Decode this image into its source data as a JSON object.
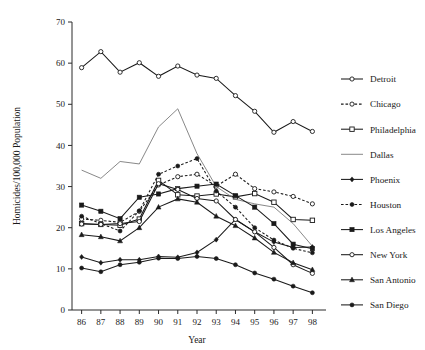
{
  "chart_data": {
    "type": "line",
    "title": "",
    "xlabel": "Year",
    "ylabel": "Homicides/100,000 Population",
    "categories": [
      "86",
      "87",
      "88",
      "89",
      "90",
      "91",
      "92",
      "93",
      "94",
      "95",
      "96",
      "97",
      "98"
    ],
    "x": [
      86,
      87,
      88,
      89,
      90,
      91,
      92,
      93,
      94,
      95,
      96,
      97,
      98
    ],
    "xlim": [
      85.5,
      98.5
    ],
    "ylim": [
      0,
      70
    ],
    "yticks": [
      0,
      10,
      20,
      30,
      40,
      50,
      60,
      70
    ],
    "grid": false,
    "legend_position": "right",
    "series": [
      {
        "name": "Detroit",
        "marker": "open-circle",
        "dash": "solid",
        "color": "#1a1a1a",
        "values": [
          58.9,
          62.8,
          57.8,
          60.1,
          56.8,
          59.3,
          57.1,
          56.3,
          52.1,
          48.3,
          43.2,
          45.8,
          43.4
        ]
      },
      {
        "name": "Chicago",
        "marker": "open-circle",
        "dash": "dotted",
        "color": "#1a1a1a",
        "values": [
          22.1,
          21.8,
          21.3,
          24.0,
          30.4,
          32.4,
          33.0,
          30.1,
          33.0,
          29.5,
          28.7,
          27.6,
          25.8
        ]
      },
      {
        "name": "Philadelphia",
        "marker": "open-square",
        "dash": "solid",
        "color": "#1a1a1a",
        "values": [
          21.0,
          20.8,
          20.6,
          22.1,
          31.5,
          28.0,
          27.7,
          28.2,
          27.5,
          28.3,
          26.2,
          22.0,
          21.8
        ]
      },
      {
        "name": "Dallas",
        "marker": "none",
        "dash": "solid",
        "color": "#7a7a7a",
        "values": [
          34.0,
          32.0,
          36.1,
          35.5,
          44.5,
          48.9,
          38.0,
          30.0,
          26.9,
          25.8,
          25.0,
          21.0,
          15.5
        ]
      },
      {
        "name": "Phoenix",
        "marker": "filled-diamond",
        "dash": "solid",
        "color": "#1a1a1a",
        "values": [
          12.9,
          11.5,
          12.2,
          12.2,
          13.0,
          12.8,
          14.0,
          17.1,
          22.0,
          19.0,
          16.5,
          15.2,
          15.3
        ]
      },
      {
        "name": "Houston",
        "marker": "filled-circle",
        "dash": "dotted",
        "color": "#1a1a1a",
        "values": [
          22.8,
          21.0,
          19.2,
          24.1,
          33.0,
          35.0,
          36.8,
          28.9,
          25.0,
          20.0,
          17.0,
          15.0,
          13.9
        ]
      },
      {
        "name": "Los Angeles",
        "marker": "filled-square",
        "dash": "solid",
        "color": "#1a1a1a",
        "values": [
          25.5,
          24.0,
          22.2,
          27.4,
          28.2,
          29.5,
          30.1,
          30.6,
          27.8,
          25.0,
          21.0,
          16.0,
          14.9
        ]
      },
      {
        "name": "New York",
        "marker": "open-circle",
        "dash": "solid",
        "color": "#1a1a1a",
        "values": [
          20.9,
          20.8,
          21.0,
          21.5,
          30.7,
          29.3,
          27.1,
          26.5,
          22.0,
          19.0,
          15.2,
          11.0,
          8.9
        ]
      },
      {
        "name": "San Antonio",
        "marker": "filled-triangle",
        "dash": "solid",
        "color": "#1a1a1a",
        "values": [
          18.3,
          17.8,
          16.8,
          20.0,
          25.0,
          27.0,
          26.2,
          22.8,
          20.5,
          17.5,
          14.0,
          11.5,
          9.8
        ]
      },
      {
        "name": "San Diego",
        "marker": "filled-circle",
        "dash": "solid",
        "color": "#1a1a1a",
        "values": [
          10.2,
          9.3,
          11.0,
          11.6,
          12.6,
          12.5,
          13.0,
          12.5,
          11.0,
          9.0,
          7.5,
          5.8,
          4.2
        ]
      }
    ]
  },
  "axes": {
    "y_title": "Homicides/100,000 Population",
    "x_title": "Year",
    "y_tick_labels": [
      "0",
      "10",
      "20",
      "30",
      "40",
      "50",
      "60",
      "70"
    ],
    "x_tick_labels": [
      "86",
      "87",
      "88",
      "89",
      "90",
      "91",
      "92",
      "93",
      "94",
      "95",
      "96",
      "97",
      "98"
    ]
  },
  "legend": {
    "entries": [
      {
        "label": "Detroit"
      },
      {
        "label": "Chicago"
      },
      {
        "label": "Philadelphia"
      },
      {
        "label": "Dallas"
      },
      {
        "label": "Phoenix"
      },
      {
        "label": "Houston"
      },
      {
        "label": "Los Angeles"
      },
      {
        "label": "New York"
      },
      {
        "label": "San Antonio"
      },
      {
        "label": "San Diego"
      }
    ]
  },
  "colors": {
    "ink": "#1a1a1a",
    "gray_series": "#7a7a7a",
    "background": "#ffffff"
  }
}
